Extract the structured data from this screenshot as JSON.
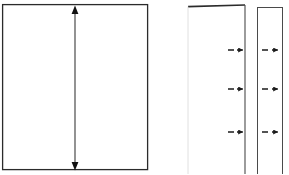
{
  "figure": {
    "title": "",
    "type": "line-diagram",
    "background_color": "#ffffff",
    "stroke_color": "#2b2b2b",
    "fill_color": "#ffffff",
    "width": 289,
    "height": 174
  },
  "shapes": {
    "main_panel": {
      "name": "large-rectangle",
      "x": 2,
      "y": 4,
      "width": 146,
      "height": 166,
      "stroke_width": 1.2
    },
    "middle_panel": {
      "name": "middle-narrow-rectangle",
      "x": 188,
      "y": 5,
      "width": 57,
      "height": 169,
      "stroke_width": 1.0
    },
    "right_panel": {
      "name": "right-narrow-rectangle",
      "x": 257,
      "y": 7,
      "width": 26,
      "height": 167,
      "stroke_width": 1.0
    }
  },
  "annotations": {
    "vertical_dimension_arrow": {
      "name": "vertical-double-arrow",
      "x": 75,
      "y_top": 8,
      "y_bottom": 168,
      "head_size": 5,
      "label": ""
    },
    "markers_middle": [
      {
        "name": "marker-1",
        "y": 50,
        "dash_x1": 228,
        "dash_x2": 234,
        "arrow_x1": 237,
        "arrow_x2": 245
      },
      {
        "name": "marker-2",
        "y": 89,
        "dash_x1": 228,
        "dash_x2": 234,
        "arrow_x1": 237,
        "arrow_x2": 245
      },
      {
        "name": "marker-3",
        "y": 132,
        "dash_x1": 228,
        "dash_x2": 234,
        "arrow_x1": 237,
        "arrow_x2": 245
      }
    ],
    "markers_right": [
      {
        "name": "marker-1",
        "y": 50,
        "dash_x1": 262,
        "dash_x2": 268,
        "arrow_x1": 272,
        "arrow_x2": 280
      },
      {
        "name": "marker-2",
        "y": 89,
        "dash_x1": 262,
        "dash_x2": 268,
        "arrow_x1": 272,
        "arrow_x2": 280
      },
      {
        "name": "marker-3",
        "y": 132,
        "dash_x1": 262,
        "dash_x2": 268,
        "arrow_x1": 272,
        "arrow_x2": 280
      }
    ]
  },
  "labels": {
    "main_panel_label": "",
    "middle_panel_label": "",
    "right_panel_label": "",
    "caption": ""
  }
}
